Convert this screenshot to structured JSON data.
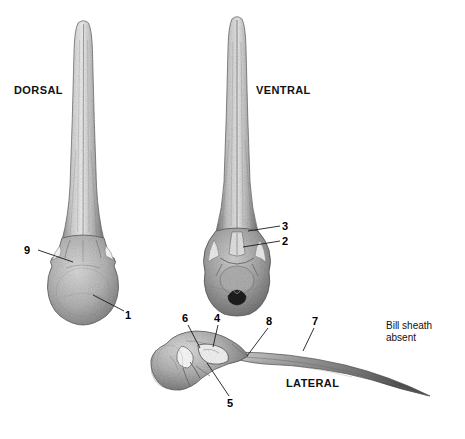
{
  "figure": {
    "background_color": "#ffffff",
    "ink_color": "#2b2b2b"
  },
  "view_labels": [
    {
      "id": "dorsal",
      "text": "DORSAL",
      "x": 14,
      "y": 84
    },
    {
      "id": "ventral",
      "text": "VENTRAL",
      "x": 256,
      "y": 84
    },
    {
      "id": "lateral",
      "text": "LATERAL",
      "x": 286,
      "y": 377
    }
  ],
  "annotations": {
    "bill_sheath": {
      "line1": "Bill sheath",
      "line2": "absent",
      "x": 386,
      "y": 320
    }
  },
  "callouts": [
    {
      "number": "9",
      "view": "dorsal",
      "label_x": 24,
      "label_y": 244,
      "line": {
        "x1": 38,
        "y1": 250,
        "x2": 73,
        "y2": 262
      }
    },
    {
      "number": "1",
      "view": "dorsal",
      "label_x": 125,
      "label_y": 309,
      "line": {
        "x1": 124,
        "y1": 311,
        "x2": 93,
        "y2": 295
      }
    },
    {
      "number": "3",
      "view": "ventral",
      "label_x": 282,
      "label_y": 220,
      "line": {
        "x1": 280,
        "y1": 226,
        "x2": 248,
        "y2": 231
      }
    },
    {
      "number": "2",
      "view": "ventral",
      "label_x": 282,
      "label_y": 235,
      "line": {
        "x1": 280,
        "y1": 241,
        "x2": 243,
        "y2": 247
      }
    },
    {
      "number": "6",
      "view": "lateral",
      "label_x": 182,
      "label_y": 312,
      "line": {
        "x1": 188,
        "y1": 325,
        "x2": 200,
        "y2": 348
      }
    },
    {
      "number": "4",
      "view": "lateral",
      "label_x": 214,
      "label_y": 312,
      "line": {
        "x1": 218,
        "y1": 325,
        "x2": 213,
        "y2": 347
      }
    },
    {
      "number": "8",
      "view": "lateral",
      "label_x": 266,
      "label_y": 315,
      "line": {
        "x1": 268,
        "y1": 328,
        "x2": 247,
        "y2": 356
      }
    },
    {
      "number": "7",
      "view": "lateral",
      "label_x": 312,
      "label_y": 315,
      "line": {
        "x1": 314,
        "y1": 328,
        "x2": 303,
        "y2": 351
      }
    },
    {
      "number": "5",
      "view": "lateral",
      "label_x": 227,
      "label_y": 397,
      "line": {
        "x1": 229,
        "y1": 396,
        "x2": 207,
        "y2": 363
      }
    }
  ],
  "specimens": [
    {
      "id": "dorsal-skull",
      "view": "DORSAL",
      "bill_tip_y": 22,
      "cranium_center": {
        "x": 83,
        "y": 280
      }
    },
    {
      "id": "ventral-skull",
      "view": "VENTRAL",
      "bill_tip_y": 18,
      "cranium_center": {
        "x": 237,
        "y": 272
      }
    },
    {
      "id": "lateral-skull",
      "view": "LATERAL",
      "bill_tip": {
        "x": 430,
        "y": 396
      },
      "cranium_center": {
        "x": 186,
        "y": 365
      }
    }
  ]
}
